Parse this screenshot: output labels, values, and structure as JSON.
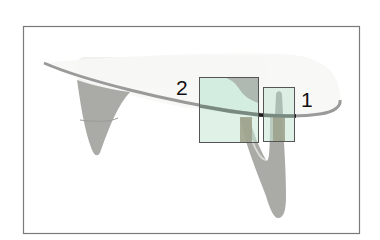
{
  "figure": {
    "frame_color": "#7a7a7a",
    "highlight_box_fill": "#c6e8d6",
    "highlight_box_stroke": "#555555",
    "annotations": [
      {
        "id": "1",
        "label": "1",
        "region": "glass-top contact point on right leg"
      },
      {
        "id": "2",
        "label": "2",
        "region": "glass-top contact point on central support"
      }
    ]
  },
  "colors": {
    "glass_edge": "#9a9a9a",
    "glass_edge_dark": "#1a1a1a",
    "leg_gray": "#a9a9a4",
    "wood_brown": "#6b4a2e"
  }
}
